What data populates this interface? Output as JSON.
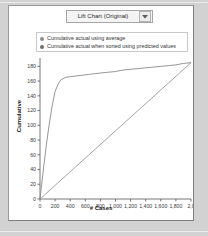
{
  "window": {
    "background_color": "#d2d2d2",
    "panel_color": "#ffffff"
  },
  "toolbar": {
    "chart_select": {
      "selected": "Lift Chart (Original)",
      "arrow_icon": "chevron-down-icon"
    }
  },
  "legend": {
    "position": "top",
    "entries": [
      {
        "label": "Cumulative actual using average",
        "color": "#8c8c8c"
      },
      {
        "label": "Cumulative actual when sorted using predicted values",
        "color": "#6e6e6e"
      }
    ]
  },
  "chart_data": {
    "type": "line",
    "title": "Lift Chart (Original)",
    "xlabel": "# Cases",
    "ylabel": "Cumulative",
    "xlim": [
      0,
      2000
    ],
    "ylim": [
      0,
      190
    ],
    "grid": false,
    "legend_position": "top",
    "xticks": [
      0,
      200,
      400,
      600,
      800,
      1000,
      1200,
      1400,
      1600,
      1800,
      2000
    ],
    "xtick_labels": [
      "0",
      "200",
      "400",
      "600",
      "800",
      "1,000",
      "1,200",
      "1,400",
      "1,600",
      "1,800",
      "2,0"
    ],
    "yticks": [
      0,
      20,
      40,
      60,
      80,
      100,
      120,
      140,
      160,
      180
    ],
    "ytick_labels": [
      "0",
      "20",
      "40",
      "60",
      "80",
      "100",
      "120",
      "140",
      "160",
      "180"
    ],
    "series": [
      {
        "name": "Cumulative actual using average",
        "color": "#9a9a9a",
        "x": [
          0,
          2000
        ],
        "y": [
          0,
          185
        ]
      },
      {
        "name": "Cumulative actual when sorted using predicted values",
        "color": "#8a8a8a",
        "x": [
          0,
          40,
          80,
          120,
          160,
          200,
          240,
          280,
          340,
          400,
          480,
          560,
          640,
          720,
          800,
          900,
          1000,
          1100,
          1200,
          1300,
          1400,
          1500,
          1600,
          1700,
          1800,
          1900,
          2000
        ],
        "y": [
          0,
          36,
          70,
          100,
          126,
          146,
          156,
          162,
          165,
          166,
          167,
          168,
          169,
          170,
          171,
          172,
          173,
          175,
          176,
          177,
          178,
          179,
          180,
          181,
          182,
          184,
          185
        ]
      }
    ]
  }
}
